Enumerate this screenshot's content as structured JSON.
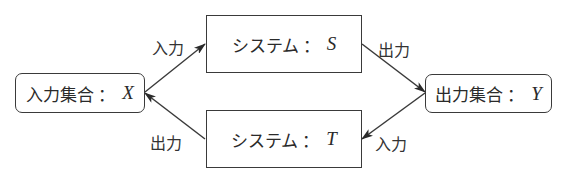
{
  "diagram": {
    "type": "flow",
    "nodes": {
      "input_set": {
        "label": "入力集合",
        "separator": "：",
        "var": "X",
        "shape": "rounded-rect"
      },
      "system_s": {
        "label": "システム",
        "separator": "：",
        "var": "S",
        "shape": "rect"
      },
      "system_t": {
        "label": "システム",
        "separator": "：",
        "var": "T",
        "shape": "rect"
      },
      "output_set": {
        "label": "出力集合",
        "separator": "：",
        "var": "Y",
        "shape": "rounded-rect"
      }
    },
    "edges": [
      {
        "from": "input_set",
        "to": "system_s",
        "label": "入力"
      },
      {
        "from": "system_s",
        "to": "output_set",
        "label": "出力"
      },
      {
        "from": "output_set",
        "to": "system_t",
        "label": "入力"
      },
      {
        "from": "system_t",
        "to": "input_set",
        "label": "出力"
      }
    ],
    "colors": {
      "stroke": "#3a3a3a",
      "text": "#2a2a2a",
      "background": "#ffffff"
    }
  }
}
